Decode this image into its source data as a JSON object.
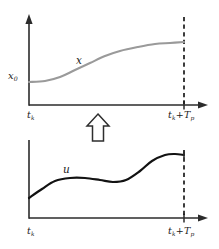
{
  "figure": {
    "kind": "two-panel-trajectory-diagram",
    "background_color": "#ffffff",
    "colors": {
      "state_curve": "#9a9a9a",
      "input_curve": "#121212",
      "axis": "#2b2b2b",
      "dashed_horizon": "#1a1a1a",
      "arrow_fill": "#ffffff",
      "arrow_stroke": "#2e2e2e"
    }
  },
  "top_panel": {
    "name": "state-trajectory-panel",
    "y_axis_initial_label": "x",
    "y_axis_initial_sub": "0",
    "curve_label": "x",
    "x_start_label": "t",
    "x_start_sub": "k",
    "x_end_label_base": "t",
    "x_end_sub_1": "k",
    "x_end_operator": "+",
    "x_end_label_term": "T",
    "x_end_sub_2": "p"
  },
  "bottom_panel": {
    "name": "control-input-panel",
    "curve_label": "u",
    "x_start_label": "t",
    "x_start_sub": "k",
    "x_end_label_base": "t",
    "x_end_sub_1": "k",
    "x_end_operator": "+",
    "x_end_label_term": "T",
    "x_end_sub_2": "p"
  },
  "connector": {
    "name": "up-arrow",
    "direction": "up",
    "style": "hollow-outline"
  },
  "chart_data": {
    "type": "line",
    "title": "",
    "xlabel": "",
    "ylabel": "",
    "panels": [
      {
        "name": "state-trajectory",
        "series_name": "x",
        "color": "#9a9a9a",
        "style": "solid",
        "shape": "sigmoid-increasing",
        "xlim": [
          29,
          184
        ],
        "ylim_pixels": [
          105,
          18
        ],
        "x_tick_labels": [
          "t_k",
          "t_k + T_p"
        ],
        "y_tick_labels": [
          "x_0"
        ],
        "points": [
          {
            "x": 29,
            "y": 82
          },
          {
            "x": 45,
            "y": 81
          },
          {
            "x": 60,
            "y": 77
          },
          {
            "x": 75,
            "y": 70
          },
          {
            "x": 90,
            "y": 63
          },
          {
            "x": 105,
            "y": 56
          },
          {
            "x": 120,
            "y": 51
          },
          {
            "x": 138,
            "y": 47
          },
          {
            "x": 155,
            "y": 44
          },
          {
            "x": 170,
            "y": 43
          },
          {
            "x": 184,
            "y": 42
          }
        ]
      },
      {
        "name": "control-input",
        "series_name": "u",
        "color": "#121212",
        "style": "solid",
        "shape": "wavy-increasing",
        "xlim": [
          29,
          184
        ],
        "ylim_pixels": [
          218,
          145
        ],
        "x_tick_labels": [
          "t_k",
          "t_k + T_p"
        ],
        "y_tick_labels": [],
        "points": [
          {
            "x": 29,
            "y": 198
          },
          {
            "x": 42,
            "y": 189
          },
          {
            "x": 55,
            "y": 181
          },
          {
            "x": 70,
            "y": 178
          },
          {
            "x": 85,
            "y": 178
          },
          {
            "x": 100,
            "y": 180
          },
          {
            "x": 113,
            "y": 182
          },
          {
            "x": 126,
            "y": 180
          },
          {
            "x": 140,
            "y": 171
          },
          {
            "x": 152,
            "y": 161
          },
          {
            "x": 165,
            "y": 155
          },
          {
            "x": 175,
            "y": 154
          },
          {
            "x": 184,
            "y": 155
          }
        ]
      }
    ],
    "annotations": [
      {
        "text": "x_0",
        "panel": "state-trajectory",
        "position": "y-axis-left"
      },
      {
        "text": "x",
        "panel": "state-trajectory",
        "position": "above-curve"
      },
      {
        "text": "u",
        "panel": "control-input",
        "position": "above-curve"
      },
      {
        "text": "up-arrow",
        "panel": "between",
        "position": "center"
      }
    ],
    "grid": false,
    "legend": false
  }
}
